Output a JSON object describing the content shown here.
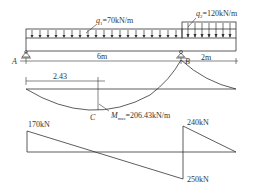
{
  "loads": {
    "q1": {
      "symbol": "q",
      "sub": "1",
      "value": "=70kN/m"
    },
    "q2": {
      "symbol": "q",
      "sub": "2",
      "value": "=120kN/m"
    }
  },
  "supports": {
    "a": "A",
    "b": "B"
  },
  "dimensions": {
    "span_ab": "6m",
    "overhang": "2m",
    "mmax_position": "2.43"
  },
  "moment_diagram": {
    "point_label": "C",
    "mmax_symbol": "M",
    "mmax_sub": "max",
    "mmax_value": "=206.43kN/m"
  },
  "shear_diagram": {
    "va_right": "170kN",
    "vb_right": "240kN",
    "vb_left": "250kN"
  },
  "colors": {
    "line": "#333333",
    "background": "#ffffff"
  }
}
